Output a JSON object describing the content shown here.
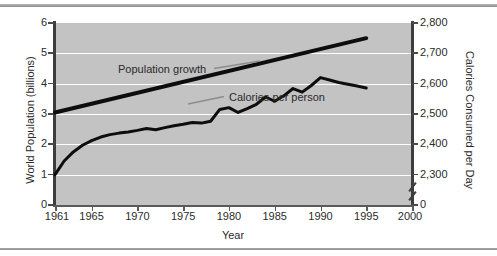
{
  "chart_data": {
    "type": "line",
    "title": "",
    "xlabel": "Year",
    "ylabel": "World Population (billions)",
    "y2label": "Calories Consumed per Day",
    "xlim": [
      1961,
      2000
    ],
    "ylim": [
      0,
      6
    ],
    "y2lim": [
      2300,
      2800
    ],
    "y2_axis_break": true,
    "grid": true,
    "legend_position": "inline-annotations",
    "x_ticks": [
      "1961",
      "1965",
      "1970",
      "1975",
      "1980",
      "1985",
      "1990",
      "1995",
      "2000"
    ],
    "y_ticks": [
      "0",
      "1",
      "2",
      "3",
      "4",
      "5",
      "6"
    ],
    "y2_ticks": [
      "0",
      "2,300",
      "2,400",
      "2,500",
      "2,600",
      "2,700",
      "2,800"
    ],
    "series": [
      {
        "name": "Population growth",
        "axis": "left",
        "x": [
          1961,
          1995
        ],
        "values": [
          3.05,
          5.5
        ]
      },
      {
        "name": "Calories per person",
        "axis": "right",
        "x": [
          1961,
          1962,
          1963,
          1964,
          1965,
          1966,
          1967,
          1968,
          1969,
          1970,
          1971,
          1972,
          1973,
          1974,
          1975,
          1976,
          1977,
          1978,
          1979,
          1980,
          1981,
          1982,
          1983,
          1984,
          1985,
          1986,
          1987,
          1988,
          1989,
          1990,
          1991,
          1992,
          1993,
          1994,
          1995
        ],
        "values": [
          2300,
          2345,
          2375,
          2397,
          2412,
          2424,
          2432,
          2437,
          2441,
          2446,
          2452,
          2448,
          2455,
          2461,
          2466,
          2472,
          2470,
          2476,
          2515,
          2521,
          2505,
          2518,
          2532,
          2556,
          2542,
          2560,
          2584,
          2572,
          2594,
          2620,
          2612,
          2604,
          2598,
          2592,
          2586
        ]
      }
    ],
    "annotations": [
      {
        "text": "Population growth",
        "points_to": "population-growth-line"
      },
      {
        "text": "Calories per person",
        "points_to": "calories-per-person-line"
      }
    ],
    "colors": {
      "plot_background": "#c3c3c3",
      "gridline": "#ffffff",
      "axis": "#3d3d3d",
      "series_line": "#0d0d0d",
      "leader_line": "#8d8d8d",
      "text": "#2b2b2b",
      "frame_rule": "#9a9a9a"
    }
  }
}
